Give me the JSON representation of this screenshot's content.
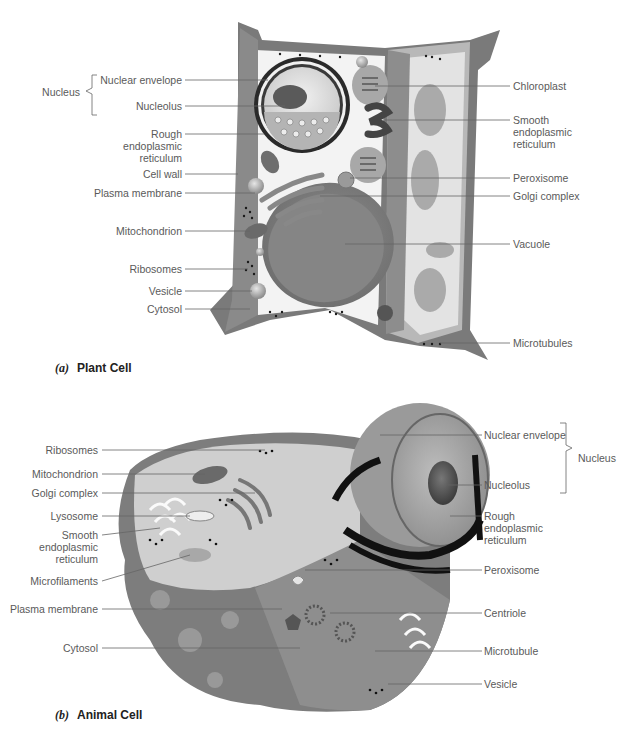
{
  "plant_cell": {
    "caption_letter": "(a)",
    "caption_title": "Plant Cell",
    "group_label": "Nucleus",
    "labels_left": [
      {
        "text": "Nuclear envelope",
        "y": 80
      },
      {
        "text": "Nucleolus",
        "y": 106
      },
      {
        "text": "Rough\nendoplasmic\nreticulum",
        "y": 134
      },
      {
        "text": "Cell wall",
        "y": 174
      },
      {
        "text": "Plasma membrane",
        "y": 193
      },
      {
        "text": "Mitochondrion",
        "y": 231
      },
      {
        "text": "Ribosomes",
        "y": 269
      },
      {
        "text": "Vesicle",
        "y": 291
      },
      {
        "text": "Cytosol",
        "y": 309
      }
    ],
    "labels_right": [
      {
        "text": "Chloroplast",
        "y": 86
      },
      {
        "text": "Smooth\nendoplasmic\nreticulum",
        "y": 120
      },
      {
        "text": "Peroxisome",
        "y": 178
      },
      {
        "text": "Golgi complex",
        "y": 196
      },
      {
        "text": "Vacuole",
        "y": 244
      },
      {
        "text": "Microtubules",
        "y": 343
      }
    ]
  },
  "animal_cell": {
    "caption_letter": "(b)",
    "caption_title": "Animal Cell",
    "group_label": "Nucleus",
    "labels_left": [
      {
        "text": "Ribosomes",
        "y": 450
      },
      {
        "text": "Mitochondrion",
        "y": 474
      },
      {
        "text": "Golgi complex",
        "y": 493
      },
      {
        "text": "Lysosome",
        "y": 516
      },
      {
        "text": "Smooth\nendoplasmic\nreticulum",
        "y": 535
      },
      {
        "text": "Microfilaments",
        "y": 581
      },
      {
        "text": "Plasma membrane",
        "y": 609
      },
      {
        "text": "Cytosol",
        "y": 648
      }
    ],
    "labels_right": [
      {
        "text": "Nuclear envelope",
        "y": 435
      },
      {
        "text": "Nucleolus",
        "y": 485
      },
      {
        "text": "Rough\nendoplasmic\nreticulum",
        "y": 516
      },
      {
        "text": "Peroxisome",
        "y": 570
      },
      {
        "text": "Centriole",
        "y": 613
      },
      {
        "text": "Microtubule",
        "y": 651
      },
      {
        "text": "Vesicle",
        "y": 684
      }
    ]
  }
}
